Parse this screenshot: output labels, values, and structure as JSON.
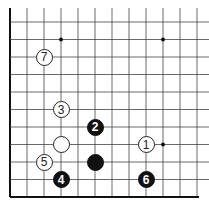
{
  "board": {
    "title": "Go board diagram",
    "line_color": "#444444",
    "edge_color": "#111111",
    "background": "#ffffff",
    "origin_x": 10,
    "origin_y": 22,
    "spacing_x": 17,
    "spacing_y": 17.5,
    "cols": 12,
    "rows": 11,
    "top_open": true,
    "right_open": true,
    "edges": [
      "left",
      "bottom"
    ]
  },
  "star_points": [
    {
      "col": 3,
      "row": 1
    },
    {
      "col": 9,
      "row": 1
    },
    {
      "col": 9,
      "row": 7
    }
  ],
  "stones": [
    {
      "color": "white",
      "col": 2,
      "row": 2,
      "label": "7"
    },
    {
      "color": "white",
      "col": 3,
      "row": 5,
      "label": "3"
    },
    {
      "color": "black",
      "col": 5,
      "row": 6,
      "label": "2"
    },
    {
      "color": "white",
      "col": 3,
      "row": 7,
      "label": ""
    },
    {
      "color": "white",
      "col": 8,
      "row": 7,
      "label": "1"
    },
    {
      "color": "white",
      "col": 2,
      "row": 8,
      "label": "5"
    },
    {
      "color": "black",
      "col": 5,
      "row": 8,
      "label": ""
    },
    {
      "color": "black",
      "col": 3,
      "row": 9,
      "label": "4"
    },
    {
      "color": "black",
      "col": 8,
      "row": 9,
      "label": "6"
    }
  ]
}
